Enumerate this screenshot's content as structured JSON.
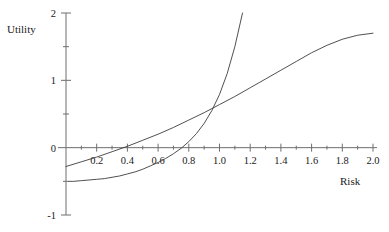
{
  "chart_data": {
    "type": "line",
    "title": "",
    "xlabel": "Risk",
    "ylabel": "Utility",
    "xlim": [
      0,
      2.0
    ],
    "ylim": [
      -1,
      2
    ],
    "grid": false,
    "legend": null,
    "xticks": [
      0.2,
      0.4,
      0.6,
      0.8,
      1.0,
      1.2,
      1.4,
      1.6,
      1.8,
      2.0
    ],
    "xtick_labels": [
      "0.2",
      "0.4",
      "0.6",
      "0.8",
      "1.0",
      "1.2",
      "1.4",
      "1.6",
      "1.8",
      "2.0"
    ],
    "x_minor_ticks": [
      0.1,
      0.3,
      0.5,
      0.7,
      0.9,
      1.1,
      1.3,
      1.5,
      1.7,
      1.9
    ],
    "yticks": [
      -1,
      0,
      1,
      2
    ],
    "ytick_labels": [
      "-1",
      "0",
      "1",
      "2"
    ],
    "y_minor_ticks": [
      -0.5,
      0.5,
      1.5
    ],
    "line_color": "#3c3c3c",
    "axis_color": "#6e6e6e",
    "series": [
      {
        "name": "convex-utility-curve",
        "x": [
          0.0,
          0.1,
          0.2,
          0.3,
          0.4,
          0.5,
          0.6,
          0.7,
          0.8,
          0.9,
          1.0,
          1.1,
          1.2,
          1.3,
          1.4,
          1.5,
          1.6,
          1.7,
          1.8,
          1.9,
          2.0
        ],
        "y": [
          -0.28,
          -0.21,
          -0.14,
          -0.06,
          0.02,
          0.11,
          0.2,
          0.3,
          0.41,
          0.52,
          0.64,
          0.76,
          0.89,
          1.02,
          1.15,
          1.28,
          1.41,
          1.52,
          1.61,
          1.67,
          1.7
        ]
      },
      {
        "name": "steep-utility-curve",
        "x": [
          0.02,
          0.05,
          0.1,
          0.15,
          0.2,
          0.25,
          0.3,
          0.35,
          0.4,
          0.45,
          0.5,
          0.55,
          0.6,
          0.65,
          0.7,
          0.75,
          0.8,
          0.85,
          0.9,
          0.95,
          1.0,
          1.05,
          1.1,
          1.15
        ],
        "y": [
          -0.5,
          -0.5,
          -0.49,
          -0.48,
          -0.47,
          -0.46,
          -0.44,
          -0.42,
          -0.39,
          -0.36,
          -0.32,
          -0.27,
          -0.22,
          -0.16,
          -0.09,
          -0.01,
          0.09,
          0.21,
          0.36,
          0.55,
          0.79,
          1.1,
          1.5,
          2.0
        ]
      }
    ]
  },
  "labels": {
    "y_axis_title": "Utility",
    "x_axis_title": "Risk"
  }
}
